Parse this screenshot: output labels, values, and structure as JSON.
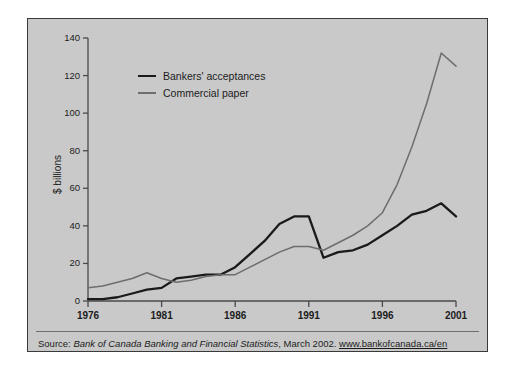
{
  "source": {
    "prefix": "Source: ",
    "publication": "Bank of Canada Banking and Financial Statistics",
    "middle": ", March 2002. ",
    "url": "www.bankofcanada.ca/en"
  },
  "chart_data": {
    "type": "line",
    "title": "",
    "subtitle": "",
    "xlabel": "",
    "ylabel": "$ billions",
    "xlim": [
      1976,
      2001
    ],
    "ylim": [
      0,
      140
    ],
    "grid": false,
    "legend_position": "upper-left-inside",
    "x_ticks": [
      "1976",
      "1981",
      "1986",
      "1991",
      "1996",
      "2001"
    ],
    "x_tick_values": [
      1976,
      1981,
      1986,
      1991,
      1996,
      2001
    ],
    "y_ticks": [
      "0",
      "20",
      "40",
      "60",
      "80",
      "100",
      "120",
      "140"
    ],
    "y_tick_values": [
      0,
      20,
      40,
      60,
      80,
      100,
      120,
      140
    ],
    "x": [
      1976,
      1977,
      1978,
      1979,
      1980,
      1981,
      1982,
      1983,
      1984,
      1985,
      1986,
      1987,
      1988,
      1989,
      1990,
      1991,
      1992,
      1993,
      1994,
      1995,
      1996,
      1997,
      1998,
      1999,
      2000,
      2001
    ],
    "series": [
      {
        "name": "Bankers' acceptances",
        "color": "#1a1a1a",
        "values": [
          1,
          1,
          2,
          4,
          6,
          7,
          12,
          13,
          14,
          14,
          18,
          25,
          32,
          41,
          45,
          45,
          23,
          26,
          27,
          30,
          35,
          40,
          46,
          48,
          52,
          45
        ]
      },
      {
        "name": "Commercial paper",
        "color": "#6d6d6d",
        "values": [
          7,
          8,
          10,
          12,
          15,
          12,
          10,
          11,
          13,
          14,
          14,
          18,
          22,
          26,
          29,
          29,
          27,
          31,
          35,
          40,
          47,
          62,
          82,
          105,
          132,
          125
        ]
      }
    ]
  }
}
